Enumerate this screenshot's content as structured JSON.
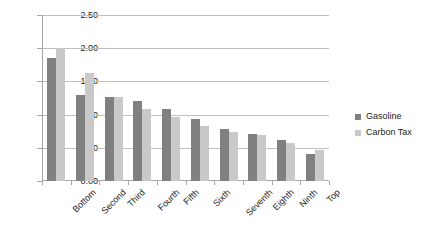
{
  "chart_data": {
    "type": "bar",
    "title": "",
    "subtitle": "",
    "xlabel": "",
    "ylabel": "",
    "ylim": [
      0.0,
      2.5
    ],
    "ytick_interval": 0.5,
    "ytick_labels": [
      "2.50",
      "2.00",
      "1.50",
      "1.00",
      "0.50",
      "0.00"
    ],
    "ytick_values": [
      2.5,
      2.0,
      1.5,
      1.0,
      0.5,
      0.0
    ],
    "grid": "horizontal",
    "legend_position": "right",
    "categories": [
      "Bottom",
      "Second",
      "Third",
      "Fourth",
      "Fifth",
      "Sixth",
      "Seventh",
      "Eighth",
      "Ninth",
      "Top"
    ],
    "series": [
      {
        "name": "Gasoline",
        "color": "#808080",
        "values": [
          1.86,
          1.3,
          1.26,
          1.2,
          1.08,
          0.93,
          0.78,
          0.71,
          0.62,
          0.41
        ]
      },
      {
        "name": "Carbon Tax",
        "color": "#c9c9c9",
        "values": [
          2.0,
          1.62,
          1.26,
          1.08,
          0.96,
          0.83,
          0.74,
          0.7,
          0.58,
          0.46
        ]
      }
    ]
  },
  "legend": {
    "items": [
      {
        "label": "Gasoline",
        "swatch": "#808080"
      },
      {
        "label": "Carbon Tax",
        "swatch": "#c9c9c9"
      }
    ]
  }
}
